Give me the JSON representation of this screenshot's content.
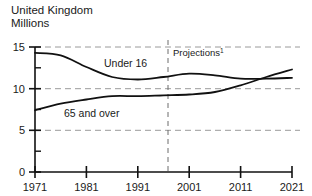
{
  "header": {
    "country_title": "United Kingdom",
    "units_subtitle": "Millions"
  },
  "chart_data": {
    "type": "line",
    "title": "United Kingdom",
    "subtitle": "Millions",
    "xlabel": "",
    "ylabel": "Millions",
    "xlim": [
      1971,
      2021
    ],
    "ylim": [
      0,
      15
    ],
    "yticks": [
      0,
      5,
      10,
      15
    ],
    "ytick_labels": [
      "0",
      "5",
      "10",
      "15"
    ],
    "xticks": [
      1971,
      1981,
      1991,
      2001,
      2011,
      2021
    ],
    "xtick_labels": [
      "1971",
      "1981",
      "1991",
      "2001",
      "2011",
      "2021"
    ],
    "grid": "horizontal-dashed",
    "legend": "inline-labels",
    "annotations": [
      {
        "name": "projections-divider",
        "text": "Projections",
        "superscript": "1",
        "x": 2001,
        "style": "vertical-dashed"
      }
    ],
    "series": [
      {
        "name": "Under 16",
        "label": "Under 16",
        "x": [
          1971,
          1976,
          1981,
          1986,
          1991,
          1996,
          2001,
          2006,
          2011,
          2016,
          2021
        ],
        "values": [
          14.3,
          14.0,
          12.6,
          11.4,
          11.1,
          11.4,
          11.8,
          11.6,
          11.2,
          11.2,
          11.3
        ]
      },
      {
        "name": "65 and over",
        "label": "65 and over",
        "x": [
          1971,
          1976,
          1981,
          1986,
          1991,
          1996,
          2001,
          2006,
          2011,
          2016,
          2021
        ],
        "values": [
          7.4,
          8.2,
          8.7,
          9.1,
          9.1,
          9.2,
          9.3,
          9.6,
          10.4,
          11.4,
          12.3
        ]
      }
    ]
  }
}
